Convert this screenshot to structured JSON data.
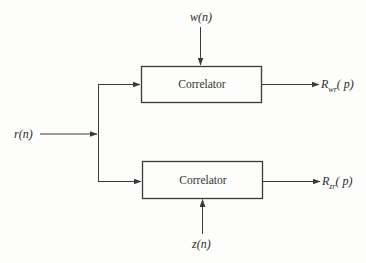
{
  "diagram": {
    "type": "block-diagram",
    "input": {
      "label": "r(n)",
      "var": "r",
      "arg": "(n)"
    },
    "blocks": [
      {
        "id": "correlator-top",
        "label": "Correlator",
        "side_input": {
          "label": "w(n)",
          "var": "w",
          "arg": "(n)",
          "direction": "from-top"
        },
        "output": {
          "label": "R_wr(p)",
          "base": "R",
          "sub": "wr",
          "arg": "( p)"
        }
      },
      {
        "id": "correlator-bottom",
        "label": "Correlator",
        "side_input": {
          "label": "z(n)",
          "var": "z",
          "arg": "(n)",
          "direction": "from-bottom"
        },
        "output": {
          "label": "R_zr(p)",
          "base": "R",
          "sub": "zr",
          "arg": "( p)"
        }
      }
    ],
    "colors": {
      "line": "#3a3a3a",
      "background": "#fdfdfb"
    }
  }
}
